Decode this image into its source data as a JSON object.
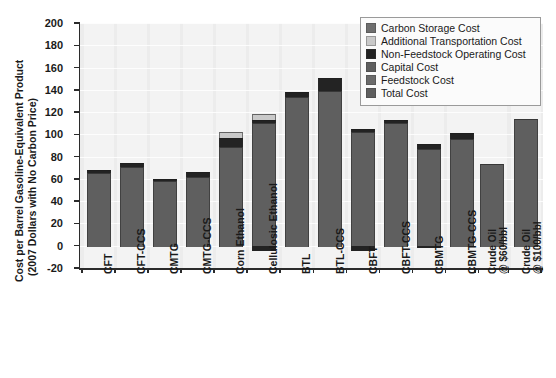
{
  "chart_data": {
    "type": "bar",
    "title": "",
    "subtitle": "",
    "stacked": true,
    "xlabel": "",
    "ylabel": "Cost per Barrel Gasoline-Equivalent Product (2007 Dollars with No Carbon Price)",
    "ylabel_line1": "Cost per Barrel Gasoline-Equivalent Product",
    "ylabel_line2": "(2007 Dollars with No Carbon Price)",
    "ylim": [
      -20,
      200
    ],
    "ytick_values": [
      -20,
      0,
      20,
      40,
      60,
      80,
      100,
      120,
      140,
      160,
      180,
      200
    ],
    "ytick_labels": [
      "-20",
      "0",
      "20",
      "40",
      "60",
      "80",
      "100",
      "120",
      "140",
      "160",
      "180",
      "200"
    ],
    "grid": "horizontal",
    "legend_position": "top-right",
    "categories": [
      "CFT",
      "CFT-CCS",
      "CMTG",
      "CMTG-CCS",
      "Corn Ethanol",
      "Cellulosic Ethanol",
      "BTL",
      "BTL-CCS",
      "CBFT",
      "CBFT-CCS",
      "CBMTG",
      "CBMTG-CCS",
      "Crude Oil @ $60/bbl",
      "Crude Oil @ $100/bbl"
    ],
    "category_label_lines": [
      [
        "CFT"
      ],
      [
        "CFT-CCS"
      ],
      [
        "CMTG"
      ],
      [
        "CMTG-CCS"
      ],
      [
        "Corn Ethanol"
      ],
      [
        "Cellulosic Ethanol"
      ],
      [
        "BTL"
      ],
      [
        "BTL-CCS"
      ],
      [
        "CBFT"
      ],
      [
        "CBFT-CCS"
      ],
      [
        "CBMTG"
      ],
      [
        "CBMTG-CCS"
      ],
      [
        "Crude Oil",
        "@ $60/bbl"
      ],
      [
        "Crude Oil",
        "@ $100/bbl"
      ]
    ],
    "series": [
      {
        "name": "Carbon Storage Cost",
        "color": "#6e6e6e",
        "values": [
          0,
          0,
          0,
          0,
          0,
          0,
          0,
          0,
          0,
          0,
          0,
          0,
          0,
          0
        ]
      },
      {
        "name": "Additional Transportation Cost",
        "color": "#c9c9c9",
        "values": [
          0,
          0,
          0,
          0,
          5,
          5,
          0,
          0,
          0,
          0,
          0,
          0,
          0,
          0
        ]
      },
      {
        "name": "Non-Feedstock Operating Cost",
        "color": "#232323",
        "values": [
          3,
          3,
          2,
          4,
          8,
          3,
          4,
          12,
          3,
          3,
          4,
          5,
          0,
          0
        ]
      },
      {
        "name": "Capital Cost",
        "color": "#5e5e5e",
        "values": [
          0,
          0,
          0,
          0,
          0,
          0,
          0,
          0,
          0,
          0,
          0,
          0,
          0,
          0
        ]
      },
      {
        "name": "Feedstock Cost",
        "color": "#6b6b6b",
        "values": [
          0,
          0,
          0,
          0,
          0,
          0,
          0,
          0,
          0,
          0,
          0,
          0,
          0,
          0
        ]
      },
      {
        "name": "Total Cost",
        "color": "#5f5f5f",
        "values": [
          65,
          71,
          58,
          62,
          89,
          110,
          134,
          139,
          102,
          110,
          87,
          96,
          73,
          114
        ]
      }
    ],
    "bar_totals": [
      68,
      74,
      60,
      66,
      102,
      118,
      138,
      151,
      105,
      113,
      91,
      101,
      73,
      114
    ],
    "negative_segments": [
      {
        "category": "Cellulosic Ethanol",
        "value": -5,
        "series": "Non-Feedstock Operating Cost"
      },
      {
        "category": "CBFT",
        "value": -5,
        "series": "Non-Feedstock Operating Cost"
      },
      {
        "category": "CBMTG",
        "value": -2,
        "series": "Non-Feedstock Operating Cost"
      }
    ],
    "legend": [
      {
        "label": "Carbon Storage Cost",
        "color": "#6e6e6e"
      },
      {
        "label": "Additional Transportation Cost",
        "color": "#c9c9c9"
      },
      {
        "label": "Non-Feedstock Operating Cost",
        "color": "#232323"
      },
      {
        "label": "Capital Cost",
        "color": "#5e5e5e"
      },
      {
        "label": "Feedstock Cost",
        "color": "#6b6b6b"
      },
      {
        "label": "Total Cost",
        "color": "#5f5f5f"
      }
    ],
    "colors": {
      "plot_background": "#ececec",
      "gridline": "#fcfcfc",
      "axis": "#2b2b2b",
      "text": "#1a1a1a",
      "legend_background": "#fbfbfb",
      "legend_border": "#9a9a9a"
    }
  }
}
